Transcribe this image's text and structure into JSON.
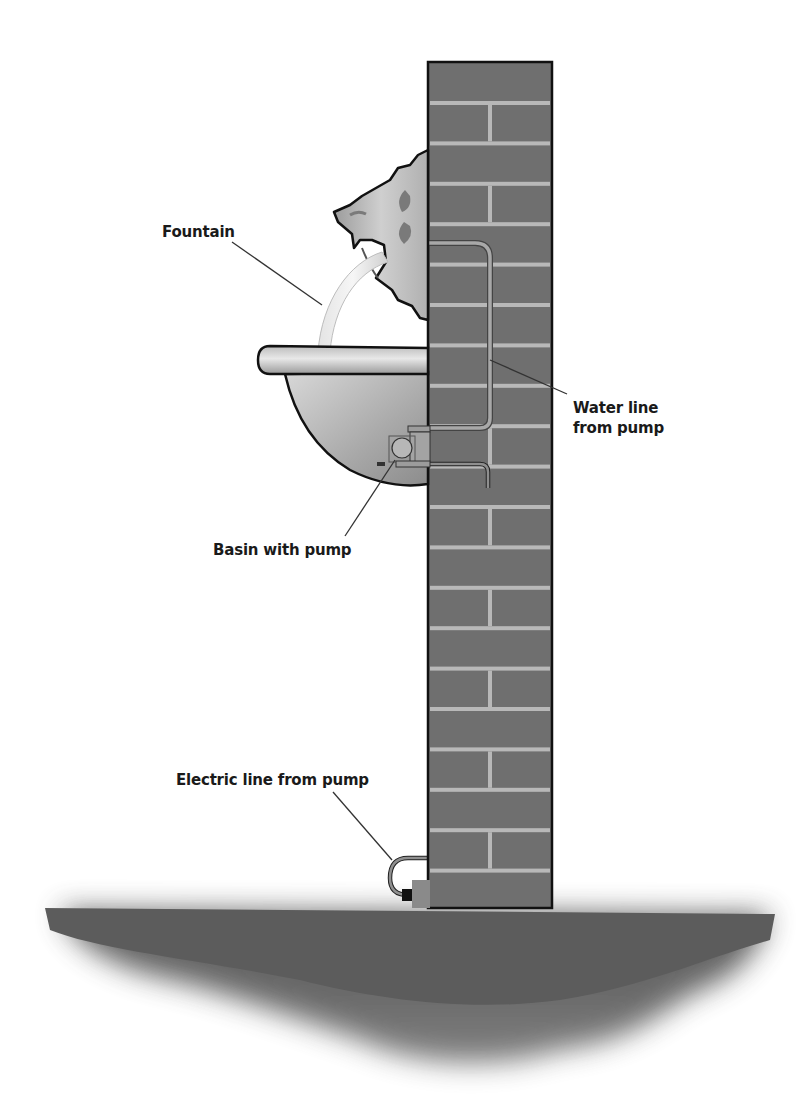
{
  "diagram": {
    "colors": {
      "background": "#ffffff",
      "brick": "#6f6f6f",
      "mortar": "#b8b8b8",
      "outline": "#111111",
      "ground": "#5e5e5e",
      "pipe": "#9a9a9a",
      "water": "#dcdcdc",
      "basin_light": "#e6e6e6",
      "basin_dark": "#8a8a8a"
    },
    "labels": [
      {
        "id": "fountain",
        "text": "Fountain",
        "x": 162,
        "y": 222
      },
      {
        "id": "water-line",
        "text": "Water line\nfrom pump",
        "x": 573,
        "y": 398
      },
      {
        "id": "basin",
        "text": "Basin with pump",
        "x": 213,
        "y": 540
      },
      {
        "id": "electric-line",
        "text": "Electric line from pump",
        "x": 176,
        "y": 770
      }
    ],
    "components": [
      "brick wall column",
      "lion head spout",
      "water stream",
      "half-round basin",
      "submersible pump",
      "water line from pump",
      "electric line from pump",
      "plug",
      "ground"
    ]
  }
}
